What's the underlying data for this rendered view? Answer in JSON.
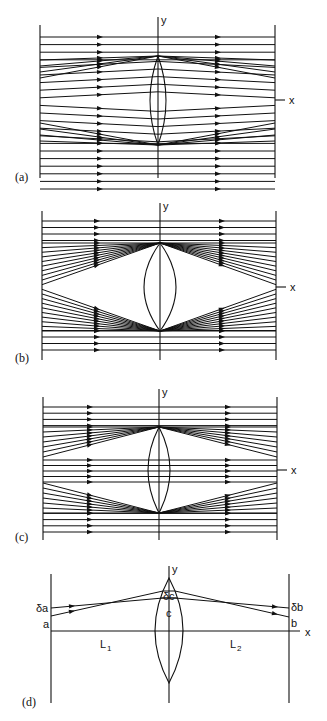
{
  "figure": {
    "panels": [
      {
        "id": "a",
        "label": "(a)",
        "label_pos": [
          15,
          181
        ],
        "left_x": 40,
        "right_x": 275,
        "top": 25,
        "bottom": 178,
        "axis_x": 158,
        "axis_y": 100,
        "lens": {
          "top": 56,
          "bottom": 145,
          "half_width": 8
        },
        "axis_labels": {
          "y": "y",
          "x": "x"
        },
        "mode": "a",
        "arrow_x_left": 100,
        "arrow_x_right": 218
      },
      {
        "id": "b",
        "label": "(b)",
        "label_pos": [
          15,
          362
        ],
        "left_x": 42,
        "right_x": 276,
        "top": 211,
        "bottom": 360,
        "axis_x": 160,
        "axis_y": 287,
        "lens": {
          "top": 243,
          "bottom": 331,
          "half_width": 16
        },
        "axis_labels": {
          "y": "y",
          "x": "x"
        },
        "mode": "b",
        "arrow_x_left": 97,
        "arrow_x_right": 222
      },
      {
        "id": "c",
        "label": "(c)",
        "label_pos": [
          15,
          541
        ],
        "left_x": 43,
        "right_x": 277,
        "top": 397,
        "bottom": 540,
        "axis_x": 159,
        "axis_y": 470,
        "lens": {
          "top": 427,
          "bottom": 513,
          "half_width": 11
        },
        "axis_labels": {
          "y": "y",
          "x": "x"
        },
        "mode": "c",
        "arrow_x_left": 90,
        "arrow_x_right": 228
      }
    ],
    "panel_d": {
      "label": "(d)",
      "label_pos": [
        22,
        706
      ],
      "left_x": 51,
      "right_x": 289,
      "top": 574,
      "bottom": 703,
      "axis_x": 169,
      "axis_y": 631,
      "x_axis_end": 300,
      "lens": {
        "top": 578,
        "bottom": 683,
        "half_width": 14
      },
      "axis_labels": {
        "y": "y",
        "x": "x"
      },
      "annotations": {
        "delta_a": "δa",
        "a": "a",
        "delta_c": "δc",
        "c": "c",
        "delta_b": "δb",
        "b": "b",
        "L1": "L",
        "L1_sub": "1",
        "L2": "L",
        "L2_sub": "2"
      },
      "rays": [
        {
          "from": [
            51,
            608
          ],
          "lens_in": [
            163,
            598
          ],
          "lens_out": [
            175,
            598
          ],
          "to": [
            289,
            608
          ],
          "arrow_left_x": 72,
          "arrow_right_x": 275
        },
        {
          "from": [
            51,
            616
          ],
          "lens_in": [
            163,
            591
          ],
          "lens_out": [
            175,
            591
          ],
          "to": [
            289,
            617
          ],
          "arrow_left_x": 72,
          "arrow_right_x": 275
        }
      ]
    },
    "caption_partial": "Schematic sketches of the ray paths ... through a thin lens"
  }
}
